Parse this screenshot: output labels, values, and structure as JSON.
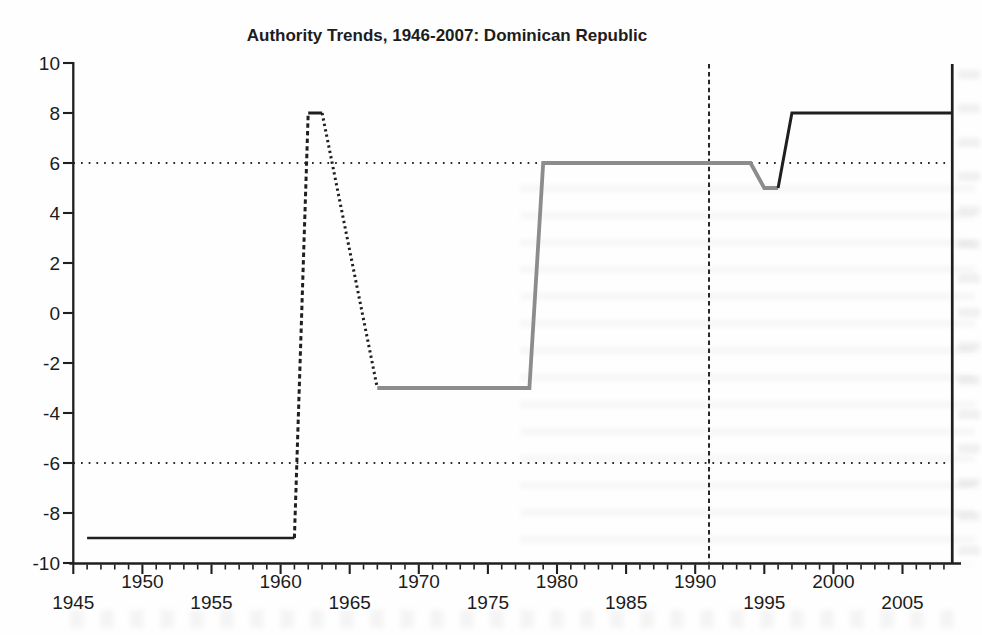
{
  "chart_data": {
    "type": "line",
    "title": "Authority Trends, 1946-2007: Dominican Republic",
    "xlabel": "",
    "ylabel": "",
    "xlim": [
      1945,
      2008.6
    ],
    "ylim": [
      -10,
      10
    ],
    "x_tick_labels": [
      "1945",
      "1950",
      "1955",
      "1960",
      "1965",
      "1970",
      "1975",
      "1980",
      "1985",
      "1990",
      "1995",
      "2000",
      "2005"
    ],
    "x_minor_tick_step_years": 1,
    "y_tick_labels": [
      "10",
      "8",
      "6",
      "4",
      "2",
      "0",
      "-2",
      "-4",
      "-6",
      "-8",
      "-10"
    ],
    "grid": "off",
    "legend": "none",
    "axis_color": "#1f1f1f",
    "thresholds": {
      "style": "dotted",
      "color": "#2a2a2a",
      "values": [
        6,
        -6
      ]
    },
    "event_marker": {
      "type": "vline",
      "x": 1991,
      "style": "dashed",
      "color": "#262626"
    },
    "series_name": "polity score",
    "segments": [
      {
        "style": "solid",
        "color": "#1f1f1f",
        "width": 2.6,
        "points": [
          [
            1946,
            -9
          ],
          [
            1961,
            -9
          ]
        ]
      },
      {
        "style": "dashed",
        "color": "#1f1f1f",
        "width": 3.0,
        "points": [
          [
            1961,
            -9
          ],
          [
            1962,
            8
          ]
        ]
      },
      {
        "style": "solid",
        "color": "#1f1f1f",
        "width": 3.0,
        "points": [
          [
            1962,
            8
          ],
          [
            1963,
            8
          ]
        ]
      },
      {
        "style": "dotted",
        "color": "#1f1f1f",
        "width": 3.0,
        "points": [
          [
            1963,
            8
          ],
          [
            1967,
            -3
          ]
        ]
      },
      {
        "style": "solid",
        "color": "#8c8c8c",
        "width": 3.8,
        "points": [
          [
            1967,
            -3
          ],
          [
            1978,
            -3
          ],
          [
            1979,
            6
          ],
          [
            1994,
            6
          ],
          [
            1995,
            5
          ],
          [
            1996,
            5
          ]
        ]
      },
      {
        "style": "solid",
        "color": "#1f1f1f",
        "width": 3.0,
        "points": [
          [
            1996,
            5
          ],
          [
            1997,
            8
          ],
          [
            2008.6,
            8
          ]
        ]
      }
    ],
    "right_spine": true
  }
}
